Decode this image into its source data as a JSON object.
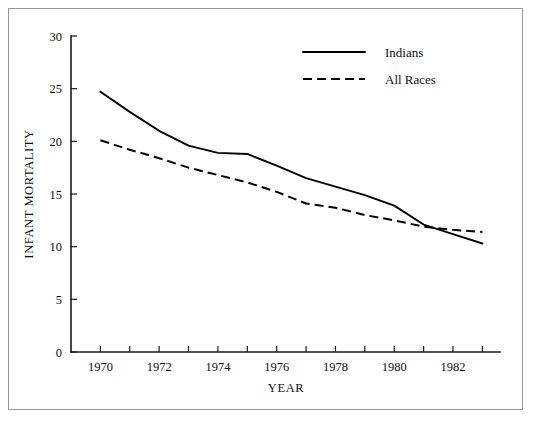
{
  "chart_data": {
    "type": "line",
    "title": "",
    "xlabel": "YEAR",
    "ylabel": "INFANT MORTALITY",
    "xlim": [
      1969,
      1983.6
    ],
    "ylim": [
      0,
      30
    ],
    "grid": false,
    "legend_position": "top-right",
    "x": [
      1970,
      1971,
      1972,
      1973,
      1974,
      1975,
      1976,
      1977,
      1978,
      1979,
      1980,
      1981,
      1982,
      1983
    ],
    "xtick_values": [
      1970,
      1971,
      1972,
      1973,
      1974,
      1975,
      1976,
      1977,
      1978,
      1979,
      1980,
      1981,
      1982,
      1983
    ],
    "xtick_labels": [
      "1970",
      "",
      "1972",
      "",
      "1974",
      "",
      "1976",
      "",
      "1978",
      "",
      "1980",
      "",
      "1982",
      ""
    ],
    "ytick_values": [
      0,
      5,
      10,
      15,
      20,
      25,
      30
    ],
    "ytick_labels": [
      "0",
      "5",
      "10",
      "15",
      "20",
      "25",
      "30"
    ],
    "series": [
      {
        "name": "Indians",
        "style": "solid",
        "color": "#000000",
        "values": [
          24.7,
          22.8,
          21.0,
          19.6,
          18.9,
          18.8,
          17.7,
          16.5,
          15.7,
          14.9,
          13.9,
          12.1,
          11.2,
          10.3
        ]
      },
      {
        "name": "All Races",
        "style": "dashed",
        "color": "#000000",
        "values": [
          20.1,
          19.2,
          18.4,
          17.5,
          16.8,
          16.1,
          15.2,
          14.1,
          13.7,
          13.0,
          12.5,
          11.9,
          11.6,
          11.4
        ]
      }
    ]
  },
  "legend": {
    "entries": [
      {
        "label": "Indians",
        "style": "solid"
      },
      {
        "label": "All Races",
        "style": "dashed"
      }
    ]
  },
  "axes": {
    "y_title": "INFANT MORTALITY",
    "x_title": "YEAR"
  }
}
